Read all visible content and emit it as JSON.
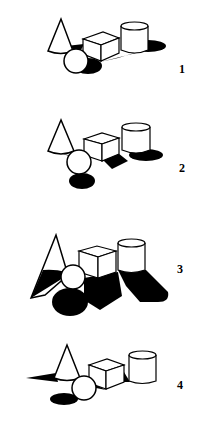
{
  "figure": {
    "colors": {
      "ink": "#000000",
      "paper": "#ffffff"
    },
    "panels": [
      {
        "label": "1",
        "shadow_style": "short shadows cast to the right"
      },
      {
        "label": "2",
        "shadow_style": "shadows cast down-right, light from upper left"
      },
      {
        "label": "3",
        "shadow_style": "long shadows cast toward the viewer, backlit"
      },
      {
        "label": "4",
        "shadow_style": "shadows cast to the left, light from right"
      }
    ]
  }
}
